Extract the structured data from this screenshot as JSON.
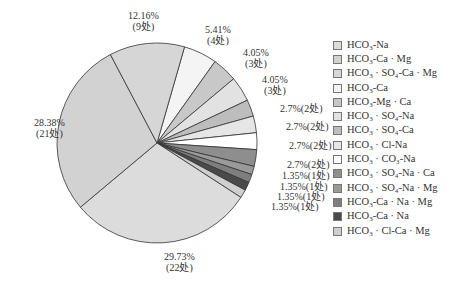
{
  "chart_data": {
    "type": "pie",
    "title": "",
    "start_angle_deg": 16,
    "direction": "clockwise",
    "legend_position": "right",
    "slices": [
      {
        "name": "HCO3-Ca",
        "legend": "HCO₃-Ca",
        "percent": 5.41,
        "count": 4,
        "label": "5.41%",
        "count_label": "(4处)",
        "color": "#f4f4f4"
      },
      {
        "name": "HCO3-Mg·Ca",
        "legend": "HCO₃-Mg · Ca",
        "percent": 4.05,
        "count": 3,
        "label": "4.05%",
        "count_label": "(3处)",
        "color": "#c8c8c8"
      },
      {
        "name": "HCO3·SO4-Na",
        "legend": "HCO₃ · SO₄-Na",
        "percent": 4.05,
        "count": 3,
        "label": "4.05%",
        "count_label": "(3处)",
        "color": "#e2e2e2"
      },
      {
        "name": "HCO3·SO4-Ca",
        "legend": "HCO₃ · SO₄-Ca",
        "percent": 2.7,
        "count": 2,
        "label": "2.7%(2处)",
        "count_label": "",
        "color": "#bdbdbd"
      },
      {
        "name": "HCO3·Cl-Na",
        "legend": "HCO₃ · Cl-Na",
        "percent": 2.7,
        "count": 2,
        "label": "2.7%(2处)",
        "count_label": "",
        "color": "#e6e6e6"
      },
      {
        "name": "HCO3·CO3-Na",
        "legend": "HCO₃ · CO₃-Na",
        "percent": 2.7,
        "count": 2,
        "label": "2.7%(2处)",
        "count_label": "",
        "color": "#ffffff"
      },
      {
        "name": "HCO3·SO4-Na·Ca",
        "legend": "HCO₃ · SO₄-Na · Ca",
        "percent": 2.7,
        "count": 2,
        "label": "2.7%(2处)",
        "count_label": "",
        "color": "#8e8e8e"
      },
      {
        "name": "HCO3·SO4-Na·Mg",
        "legend": "HCO₃ · SO₄-Na · Mg",
        "percent": 1.35,
        "count": 1,
        "label": "1.35%(1处)",
        "count_label": "",
        "color": "#9a9a9a"
      },
      {
        "name": "HCO3-Ca·Na·Mg",
        "legend": "HCO₃-Ca · Na · Mg",
        "percent": 1.35,
        "count": 1,
        "label": "1.35%(1处)",
        "count_label": "",
        "color": "#7e7e7e"
      },
      {
        "name": "HCO3-Ca·Na",
        "legend": "HCO₃-Ca · Na",
        "percent": 1.35,
        "count": 1,
        "label": "1.35%(1处)",
        "count_label": "",
        "color": "#4a4a4a"
      },
      {
        "name": "HCO3·Cl-Ca·Mg",
        "legend": "HCO₃ · Cl-Ca · Mg",
        "percent": 1.35,
        "count": 1,
        "label": "1.35%(1处)",
        "count_label": "",
        "color": "#cfcfcf"
      },
      {
        "name": "HCO3-Na",
        "legend": "HCO₃-Na",
        "percent": 29.73,
        "count": 22,
        "label": "29.73%",
        "count_label": "(22处)",
        "color": "#dcdcdc"
      },
      {
        "name": "HCO3-Ca·Mg",
        "legend": "HCO₃-Ca · Mg",
        "percent": 28.38,
        "count": 21,
        "label": "28.38%",
        "count_label": "(21处)",
        "color": "#d2d2d2"
      },
      {
        "name": "HCO3·SO4-Ca·Mg",
        "legend": "HCO₃ · SO₄-Ca · Mg",
        "percent": 12.16,
        "count": 9,
        "label": "12.16%",
        "count_label": "(9处)",
        "color": "#d6d6d6"
      }
    ]
  },
  "labels": [
    {
      "text": "12.16%",
      "sub": "(9处)",
      "x": 128,
      "y": 10
    },
    {
      "text": "5.41%",
      "sub": "(4处)",
      "x": 205,
      "y": 24
    },
    {
      "text": "4.05%",
      "sub": "(3处)",
      "x": 243,
      "y": 47
    },
    {
      "text": "4.05%",
      "sub": "(3处)",
      "x": 262,
      "y": 74
    },
    {
      "text": "2.7%(2处)",
      "sub": "",
      "x": 280,
      "y": 103
    },
    {
      "text": "2.7%(2处)",
      "sub": "",
      "x": 286,
      "y": 121
    },
    {
      "text": "2.7%(2处)",
      "sub": "",
      "x": 289,
      "y": 140
    },
    {
      "text": "2.7%(2处)",
      "sub": "",
      "x": 287,
      "y": 159
    },
    {
      "text": "1.35%(1处)",
      "sub": "",
      "x": 282,
      "y": 170
    },
    {
      "text": "1.35%(1处)",
      "sub": "",
      "x": 280,
      "y": 181
    },
    {
      "text": "1.35%(1处)",
      "sub": "",
      "x": 277,
      "y": 191
    },
    {
      "text": "1.35%(1处)",
      "sub": "",
      "x": 271,
      "y": 201
    },
    {
      "text": "29.73%",
      "sub": "(22处)",
      "x": 164,
      "y": 251
    },
    {
      "text": "28.38%",
      "sub": "(21处)",
      "x": 34,
      "y": 117
    }
  ],
  "legend": [
    {
      "base": "HCO",
      "sub1": "3",
      "rest": "-Na",
      "color": "#dcdcdc"
    },
    {
      "base": "HCO",
      "sub1": "3",
      "rest": "-Ca · Mg",
      "color": "#d2d2d2"
    },
    {
      "base": "HCO",
      "sub1": "3",
      "rest": " · SO₄-Ca · Mg",
      "color": "#d6d6d6"
    },
    {
      "base": "HCO",
      "sub1": "3",
      "rest": "-Ca",
      "color": "#f4f4f4"
    },
    {
      "base": "HCO",
      "sub1": "3",
      "rest": "-Mg · Ca",
      "color": "#c8c8c8"
    },
    {
      "base": "HCO",
      "sub1": "3",
      "rest": " · SO₄-Na",
      "color": "#e2e2e2"
    },
    {
      "base": "HCO",
      "sub1": "3",
      "rest": " · SO₄-Ca",
      "color": "#bdbdbd"
    },
    {
      "base": "HCO",
      "sub1": "3",
      "rest": " · Cl-Na",
      "color": "#e6e6e6"
    },
    {
      "base": "HCO",
      "sub1": "3",
      "rest": " · CO₃-Na",
      "color": "#ffffff"
    },
    {
      "base": "HCO",
      "sub1": "3",
      "rest": " · SO₄-Na · Ca",
      "color": "#8e8e8e"
    },
    {
      "base": "HCO",
      "sub1": "3",
      "rest": " · SO₄-Na · Mg",
      "color": "#9a9a9a"
    },
    {
      "base": "HCO",
      "sub1": "3",
      "rest": "-Ca · Na · Mg",
      "color": "#7e7e7e"
    },
    {
      "base": "HCO",
      "sub1": "3",
      "rest": "-Ca · Na",
      "color": "#4a4a4a"
    },
    {
      "base": "HCO",
      "sub1": "3",
      "rest": " · Cl-Ca · Mg",
      "color": "#cfcfcf"
    }
  ]
}
